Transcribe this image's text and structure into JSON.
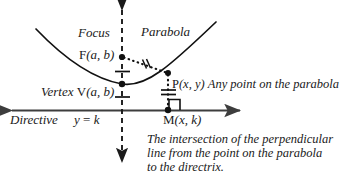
{
  "figure": {
    "colors": {
      "ink": "#1a1a1a",
      "curve": "#111111",
      "axis": "#3d3d3d",
      "background": "#ffffff"
    }
  },
  "labels": {
    "focus": "Focus",
    "parabola": "Parabola",
    "focus_point": "F(a, b)",
    "focus_point_name": "F",
    "focus_point_args": "(a, b)",
    "vertex_word": "Vertex",
    "vertex_point": "V(a, b)",
    "vertex_point_name": "V",
    "vertex_point_args": "(a, b)",
    "point_p_name": "P",
    "point_p_args": "(x, y)",
    "point_p_desc": "Any point on the parabola",
    "directive": "Directive",
    "directrix_equation": "y = k",
    "directrix_equation_lhs": "y",
    "directrix_equation_eq": " = ",
    "directrix_equation_rhs": "k",
    "point_m_name": "M",
    "point_m_args": "(x, k)"
  },
  "caption": {
    "line1": "The intersection of the perpendicular",
    "line2": "line from the point on the parabola",
    "line3": "to the directrix."
  },
  "geometry": {
    "focus": {
      "x": 122,
      "y": 57
    },
    "vertex": {
      "x": 122,
      "y": 84
    },
    "point_p": {
      "x": 168,
      "y": 73
    },
    "point_m": {
      "x": 168,
      "y": 110
    },
    "axis_of_symmetry_x": 122,
    "directrix_y": 110,
    "congruence_ticks_focus_to_p": 2,
    "congruence_ticks_p_to_m": 2,
    "right_angle_marker_at": "M"
  },
  "icons": {
    "axis_arrow": "arrow-head-icon",
    "right_angle": "right-angle-marker-icon",
    "congruence_tick": "congruence-tick-icon",
    "point_dot": "point-dot-icon"
  }
}
